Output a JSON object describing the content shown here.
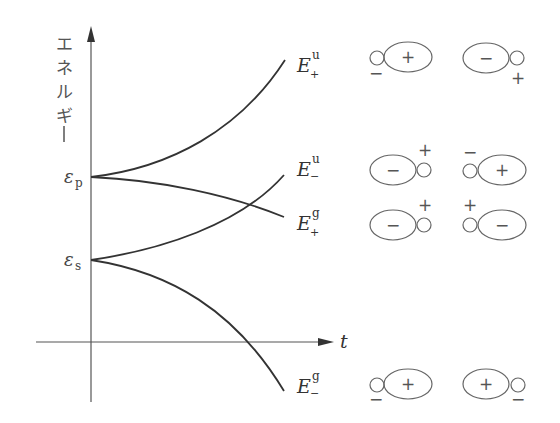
{
  "diagram": {
    "y_axis_label_chars": [
      "エ",
      "ネ",
      "ル",
      "ギ",
      "ー"
    ],
    "x_axis_label": "t",
    "levels": {
      "eps_p": {
        "symbol": "ε",
        "sub": "p"
      },
      "eps_s": {
        "symbol": "ε",
        "sub": "s"
      }
    },
    "curves": [
      {
        "name": "E_plus_u",
        "label": "E",
        "sup": "u",
        "sub": "+"
      },
      {
        "name": "E_minus_u",
        "label": "E",
        "sup": "u",
        "sub": "−"
      },
      {
        "name": "E_plus_g",
        "label": "E",
        "sup": "g",
        "sub": "+"
      },
      {
        "name": "E_minus_g",
        "label": "E",
        "sup": "g",
        "sub": "−"
      }
    ],
    "orbitals": {
      "row1": {
        "left": {
          "small_sign": "−",
          "lobe_sign": "+"
        },
        "right": {
          "lobe_sign": "−",
          "small_sign": "+"
        }
      },
      "row2": {
        "left": {
          "lobe_sign": "−",
          "small_sign": "+"
        },
        "right": {
          "small_sign": "−",
          "lobe_sign": "+"
        }
      },
      "row3": {
        "left": {
          "lobe_sign": "−",
          "small_sign": "+"
        },
        "right": {
          "small_sign": "+",
          "lobe_sign": "−"
        }
      },
      "row4": {
        "left": {
          "small_sign": "−",
          "lobe_sign": "+"
        },
        "right": {
          "lobe_sign": "+",
          "small_sign": "−"
        }
      }
    }
  }
}
